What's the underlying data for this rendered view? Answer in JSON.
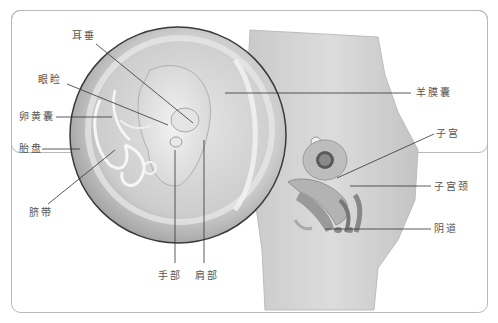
{
  "diagram": {
    "title": "",
    "labels": {
      "earlobe": "耳垂",
      "eye_socket": "眼睑",
      "yolk_sac": "卵黄囊",
      "placenta": "胎盘",
      "umbilical_cord": "脐带",
      "hand": "手部",
      "shoulder": "肩部",
      "amniotic_sac": "羊膜囊",
      "uterus": "子宫",
      "cervix": "子宫颈",
      "vagina": "阴道"
    },
    "colors": {
      "frame_border": "#b8b8b8",
      "label_text": "#555555",
      "leader_line": "#333333",
      "body_fill": "#d9d9d9",
      "circle_fill": "#cfcfcf"
    }
  }
}
